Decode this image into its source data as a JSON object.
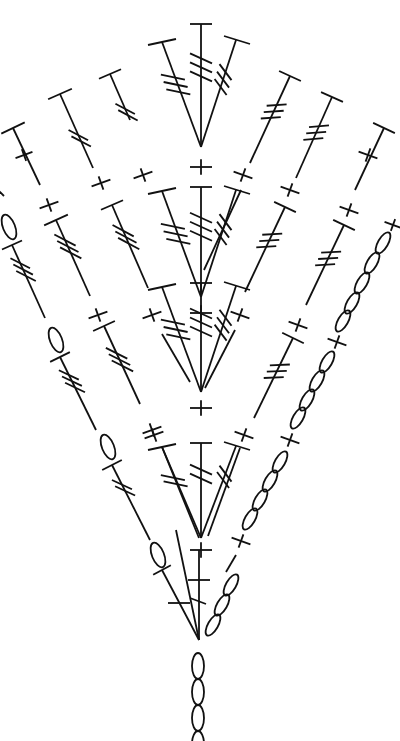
{
  "diagram": {
    "type": "crochet-chart",
    "stroke_color": "#111111",
    "background": "#ffffff",
    "legend_symbols": {
      "chain": "oval",
      "single_crochet": "plus",
      "double_crochet_top": "T-bar",
      "treble": "T-bar with 2 diagonal slashes",
      "double_treble": "T-bar with 3 diagonal slashes"
    },
    "foundation_chain": {
      "x": 198,
      "y_start": 640,
      "y_end": 741,
      "count": 4
    },
    "fans": [
      {
        "apex": [
          201,
          147
        ],
        "stems": [
          {
            "top": [
              160,
              42
            ],
            "top_len": 36,
            "slashes": 3
          },
          {
            "top": [
              201,
              24
            ],
            "top_len": 22,
            "slashes": 3
          },
          {
            "top": [
              238,
              40
            ],
            "top_len": 18,
            "slashes": 3
          }
        ]
      },
      {
        "apex": [
          201,
          297
        ],
        "stems": [
          {
            "top": [
              160,
              192
            ],
            "top_len": 20,
            "slashes": 3
          },
          {
            "top": [
              201,
              187
            ],
            "top_len": 22,
            "slashes": 3
          },
          {
            "top": [
              238,
              190
            ],
            "top_len": 18,
            "slashes": 3
          }
        ],
        "sc_above": [
          201,
          168
        ]
      },
      {
        "apex": [
          201,
          392
        ],
        "stems": [
          {
            "top": [
              160,
              288
            ],
            "top_len": 20,
            "slashes": 3
          },
          {
            "top": [
              201,
              283
            ],
            "top_len": 22,
            "slashes": 3
          },
          {
            "top": [
              238,
              287
            ],
            "top_len": 18,
            "slashes": 3
          }
        ],
        "sc_above": [
          201,
          310
        ]
      },
      {
        "apex": [
          199,
          538
        ],
        "stems": [
          {
            "top": [
              160,
              447
            ],
            "top_len": 20,
            "slashes": 2
          },
          {
            "top": [
              199,
              443
            ],
            "top_len": 22,
            "slashes": 2
          },
          {
            "top": [
              235,
              446
            ],
            "top_len": 18,
            "slashes": 2
          }
        ],
        "sc_above": [
          199,
          427
        ]
      },
      {
        "apex": [
          199,
          640
        ],
        "stems": [
          {
            "top": [
              170,
              603
            ],
            "top_len": 0,
            "slashes": 0
          },
          {
            "top": [
              199,
              580
            ],
            "top_len": 22,
            "slashes": 0
          }
        ],
        "sc_above": [
          199,
          548
        ]
      }
    ],
    "outer_rows": [
      {
        "name": "left-row-1",
        "points": [
          [
            60,
            92
          ],
          [
            154,
            296
          ]
        ]
      },
      {
        "name": "left-row-2",
        "points": [
          [
            110,
            74
          ],
          [
            198,
            280
          ]
        ]
      },
      {
        "name": "left-row-3",
        "points": [
          [
            13,
            128
          ],
          [
            41,
            185
          ]
        ]
      },
      {
        "name": "right-row-1",
        "points": [
          [
            290,
            76
          ],
          [
            240,
            185
          ]
        ]
      },
      {
        "name": "right-row-2",
        "points": [
          [
            332,
            96
          ],
          [
            268,
            237
          ]
        ]
      },
      {
        "name": "right-row-3",
        "points": [
          [
            384,
            126
          ],
          [
            350,
            198
          ]
        ]
      }
    ]
  }
}
